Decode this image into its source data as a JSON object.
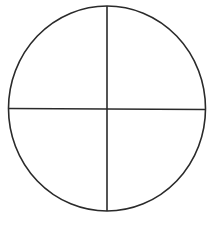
{
  "diagram": {
    "shape": "circle",
    "divisions": 4,
    "parts": [
      {
        "name": "top-left-quarter",
        "fraction": "1/4"
      },
      {
        "name": "top-right-quarter",
        "fraction": "1/4"
      },
      {
        "name": "bottom-left-quarter",
        "fraction": "1/4"
      },
      {
        "name": "bottom-right-quarter",
        "fraction": "1/4"
      }
    ],
    "stroke_color": "#2a2a2a",
    "fill_color": "#ffffff"
  }
}
